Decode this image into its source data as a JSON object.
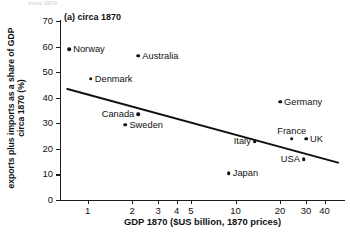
{
  "figure": {
    "panel_title": "(a) circa 1870",
    "top_clipped_caption": "circa 1870"
  },
  "chart_data": {
    "type": "scatter",
    "title": "(a) circa 1870",
    "xlabel": "GDP 1870 ($US billion, 1870 prices)",
    "ylabel": "exports plus imports as a share of GDP circa 1870 (%)",
    "xscale": "log",
    "yscale": "linear",
    "xlim": [
      0.65,
      55
    ],
    "ylim": [
      0,
      70
    ],
    "grid": false,
    "legend": "none",
    "xticks": [
      1,
      2,
      3,
      4,
      5,
      10,
      20,
      30,
      40
    ],
    "xtick_labels": [
      "1",
      "2",
      "3",
      "4",
      "5",
      "10",
      "20",
      "30",
      "40"
    ],
    "yticks": [
      0,
      10,
      20,
      30,
      40,
      50,
      60,
      70
    ],
    "ytick_labels": [
      "0",
      "10",
      "20",
      "30",
      "40",
      "50",
      "60",
      "70"
    ],
    "points": [
      {
        "label": "Norway",
        "x": 0.75,
        "y": 59.0,
        "label_pos": "right"
      },
      {
        "label": "Australia",
        "x": 2.2,
        "y": 56.5,
        "label_pos": "right"
      },
      {
        "label": "Denmark",
        "x": 1.05,
        "y": 47.5,
        "label_pos": "right"
      },
      {
        "label": "Canada",
        "x": 2.2,
        "y": 33.5,
        "label_pos": "left"
      },
      {
        "label": "Sweden",
        "x": 1.8,
        "y": 29.5,
        "label_pos": "right"
      },
      {
        "label": "Germany",
        "x": 20.0,
        "y": 38.5,
        "label_pos": "right"
      },
      {
        "label": "France",
        "x": 24.0,
        "y": 24.0,
        "label_pos": "above"
      },
      {
        "label": "UK",
        "x": 30.0,
        "y": 24.0,
        "label_pos": "right"
      },
      {
        "label": "Italy",
        "x": 13.5,
        "y": 23.0,
        "label_pos": "left"
      },
      {
        "label": "USA",
        "x": 29.0,
        "y": 16.0,
        "label_pos": "left"
      },
      {
        "label": "Japan",
        "x": 9.0,
        "y": 10.5,
        "label_pos": "right"
      }
    ],
    "trendline": {
      "description": "downward-sloping fitted line",
      "x_start": 0.72,
      "y_start": 43.5,
      "x_end": 50.0,
      "y_end": 14.5
    },
    "colors": {
      "marker": "#111111",
      "line": "#111111",
      "axis": "#1a1a1a",
      "background": "#ffffff"
    }
  }
}
